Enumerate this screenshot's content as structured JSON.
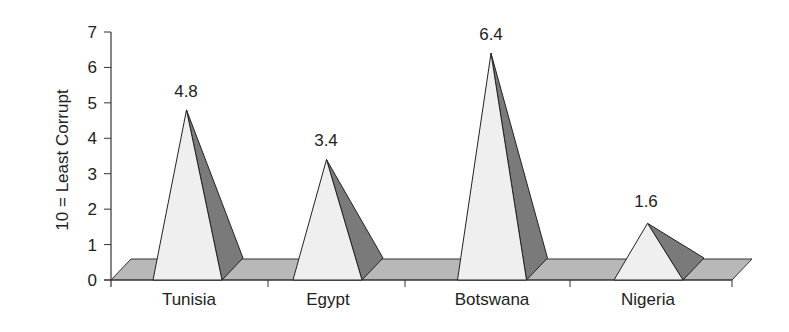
{
  "chart_data": {
    "type": "bar",
    "style": "3d-pyramid",
    "title": "",
    "xlabel": "",
    "ylabel": "10 = Least Corrupt",
    "ylim": [
      0,
      7
    ],
    "yticks": [
      "0",
      "1",
      "2",
      "3",
      "4",
      "5",
      "6",
      "7"
    ],
    "grid": false,
    "legend": null,
    "categories": [
      "Tunisia",
      "Egypt",
      "Botswana",
      "Nigeria"
    ],
    "values": [
      4.8,
      3.4,
      6.4,
      1.6
    ],
    "data_labels": [
      "4.8",
      "3.4",
      "6.4",
      "1.6"
    ]
  },
  "colors": {
    "pyramid_front": "#efefef",
    "pyramid_side": "#7a7a7a",
    "floor": "#b8b8b8",
    "axis": "#333333",
    "text": "#222222"
  }
}
